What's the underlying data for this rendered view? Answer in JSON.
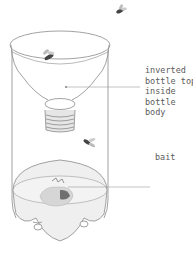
{
  "diagram": {
    "labels": {
      "inverted_top": {
        "lines": [
          "inverted",
          "bottle top",
          "inside",
          "bottle",
          "body"
        ],
        "text": "inverted\nbottle top\ninside\nbottle\nbody"
      },
      "bait": {
        "text": "bait"
      }
    },
    "colors": {
      "outline": "#8a8a8a",
      "leader_line": "#9a9a9a",
      "label_text": "#5b5b5b",
      "liquid_fill": "#ececec",
      "bait_fill": "#d9d9d9",
      "fly_body": "#444444"
    },
    "elements": {
      "flies": 3,
      "bottle_parts": [
        "bottle body",
        "inverted bottle top",
        "bottle neck threads",
        "liquid",
        "bait",
        "petaloid base"
      ]
    }
  }
}
